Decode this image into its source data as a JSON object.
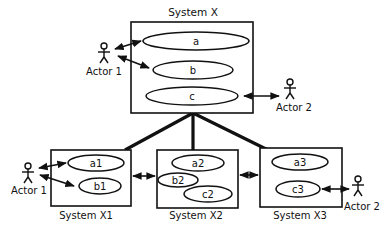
{
  "diagram": {
    "type": "uml-use-case-decomposition",
    "top_system": {
      "title": "System X",
      "use_cases": [
        "a",
        "b",
        "c"
      ],
      "actors": [
        "Actor 1",
        "Actor 2"
      ]
    },
    "subsystems": [
      {
        "title": "System X1",
        "use_cases": [
          "a1",
          "b1"
        ],
        "actor": "Actor 1"
      },
      {
        "title": "System X2",
        "use_cases": [
          "a2",
          "b2",
          "c2"
        ]
      },
      {
        "title": "System X3",
        "use_cases": [
          "a3",
          "c3"
        ],
        "actor": "Actor 2"
      }
    ]
  }
}
